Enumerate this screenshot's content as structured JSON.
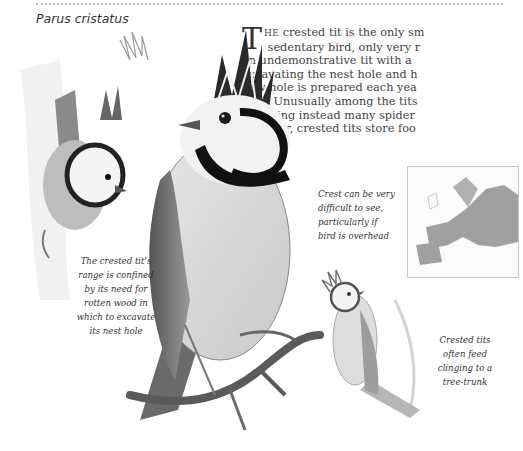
{
  "header": {
    "species_name": "Parus cristatus"
  },
  "article": {
    "dropcap": "T",
    "first_word_rest": "HE",
    "lines": [
      " crested tit is the only sm",
      "sedentary bird, only very r",
      "an undemonstrative tit with a",
      "excavating the nest hole and h",
      "new hole is prepared each yea",
      "hole. Unusually among the tits",
      "receiving instead many spider",
      "however, crested tits store foo"
    ]
  },
  "captions": {
    "range": [
      "The crested tit's",
      "range is confined",
      "by its need for",
      "rotten wood in",
      "which to excavate",
      "its nest hole"
    ],
    "crest": [
      "Crest can be very",
      "difficult to see,",
      "particularly if",
      "bird is overhead"
    ],
    "trunk": [
      "Crested tits",
      "often feed",
      "clinging to a",
      "tree-trunk"
    ]
  },
  "illustrations": {
    "main_bird": "crested-tit-perched-illustration",
    "left_bird": "crested-tit-on-trunk-illustration",
    "small_bird": "crested-tit-small-illustration",
    "map": "europe-range-map"
  },
  "colors": {
    "text": "#444444",
    "map_range": "#9a9a9a",
    "map_land": "#eeeeee",
    "rule": "#b8b8b8"
  }
}
